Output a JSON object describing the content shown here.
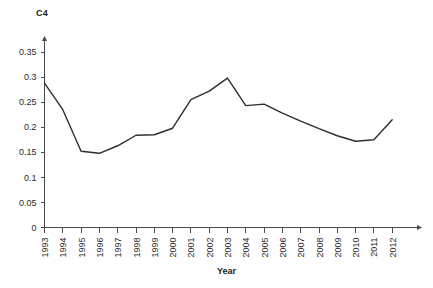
{
  "chart_data": {
    "type": "line",
    "title": "",
    "ylabel": "C4",
    "xlabel": "Year",
    "grid": false,
    "legend": null,
    "xlim": [
      1993,
      2012
    ],
    "ylim": [
      0,
      0.375
    ],
    "categories": [
      "1993",
      "1994",
      "1995",
      "1996",
      "1997",
      "1998",
      "1999",
      "2000",
      "2001",
      "2002",
      "2003",
      "2004",
      "2005",
      "2006",
      "2007",
      "2008",
      "2009",
      "2010",
      "2011",
      "2012"
    ],
    "values": [
      0.288,
      0.235,
      0.152,
      0.148,
      0.163,
      0.184,
      0.185,
      0.198,
      0.255,
      0.272,
      0.298,
      0.243,
      0.246,
      0.228,
      0.212,
      0.197,
      0.183,
      0.172,
      0.175,
      0.215
    ],
    "ytick_labels": [
      "0",
      "0.05",
      "0.1",
      "0.15",
      "0.2",
      "0.25",
      "0.3",
      "0.35"
    ],
    "ytick_values": [
      0,
      0.05,
      0.1,
      0.15,
      0.2,
      0.25,
      0.3,
      0.35
    ],
    "xtick_labels": [
      "1993",
      "1994",
      "1995",
      "1996",
      "1997",
      "1998",
      "1999",
      "2000",
      "2001",
      "2002",
      "2003",
      "2004",
      "2005",
      "2006",
      "2007",
      "2008",
      "2009",
      "2010",
      "2011",
      "2012"
    ],
    "line_color": "#2d2d2d",
    "axis_color": "#4a4a4a",
    "background_color": "#ffffff"
  }
}
